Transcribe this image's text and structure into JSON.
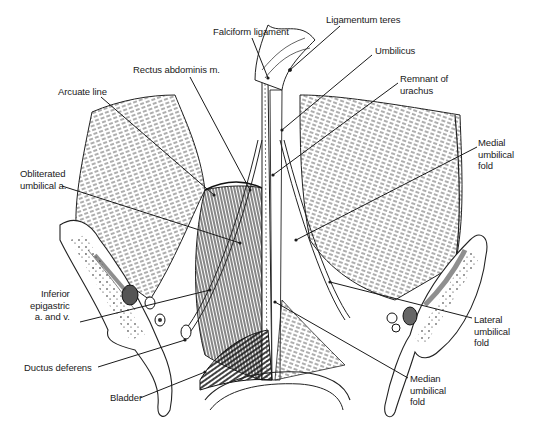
{
  "figure": {
    "width": 534,
    "height": 430,
    "ink_color": "#1a1a1a",
    "background": "#ffffff"
  },
  "labels": [
    {
      "id": "falciform-ligament",
      "text": "Falciform ligament",
      "x": 213,
      "y": 26,
      "align": "left",
      "line": [
        [
          252,
          38
        ],
        [
          268,
          78
        ]
      ]
    },
    {
      "id": "ligamentum-teres",
      "text": "Ligamentum teres",
      "x": 326,
      "y": 14,
      "align": "left",
      "line": [
        [
          340,
          26
        ],
        [
          290,
          70
        ]
      ]
    },
    {
      "id": "umbilicus",
      "text": "Umbilicus",
      "x": 375,
      "y": 45,
      "align": "left",
      "line": [
        [
          372,
          55
        ],
        [
          282,
          130
        ]
      ]
    },
    {
      "id": "rectus-abdominis",
      "text": "Rectus abdominis m.",
      "x": 133,
      "y": 64,
      "align": "left",
      "line": [
        [
          190,
          77
        ],
        [
          250,
          190
        ]
      ]
    },
    {
      "id": "remnant-of-urachus",
      "text": "Remnant of\nurachus",
      "x": 400,
      "y": 73,
      "align": "left",
      "line": [
        [
          398,
          83
        ],
        [
          273,
          175
        ]
      ]
    },
    {
      "id": "arcuate-line",
      "text": "Arcuate line",
      "x": 58,
      "y": 86,
      "align": "left",
      "line": [
        [
          101,
          97
        ],
        [
          214,
          195
        ]
      ]
    },
    {
      "id": "medial-umbilical-fold",
      "text": "Medial\numbilical\nfold",
      "x": 478,
      "y": 137,
      "align": "left",
      "line": [
        [
          477,
          147
        ],
        [
          296,
          240
        ]
      ]
    },
    {
      "id": "obliterated-umbilical-artery",
      "text": "Obliterated\numbilical a.",
      "x": 20,
      "y": 168,
      "align": "left",
      "line": [
        [
          62,
          186
        ],
        [
          240,
          243
        ]
      ]
    },
    {
      "id": "inferior-epigastric",
      "text": "Inferior\nepigastric\na. and v.",
      "x": 30,
      "y": 288,
      "align": "right",
      "line": [
        [
          80,
          322
        ],
        [
          210,
          290
        ]
      ]
    },
    {
      "id": "lateral-umbilical-fold",
      "text": "Lateral\numbilical\nfold",
      "x": 474,
      "y": 314,
      "align": "left",
      "line": [
        [
          472,
          318
        ],
        [
          330,
          282
        ]
      ]
    },
    {
      "id": "ductus-deferens",
      "text": "Ductus deferens",
      "x": 24,
      "y": 362,
      "align": "left",
      "line": [
        [
          98,
          367
        ],
        [
          185,
          340
        ]
      ]
    },
    {
      "id": "median-umbilical-fold",
      "text": "Median\numbilical\nfold",
      "x": 410,
      "y": 373,
      "align": "left",
      "line": [
        [
          408,
          378
        ],
        [
          275,
          302
        ]
      ]
    },
    {
      "id": "bladder",
      "text": "Bladder",
      "x": 110,
      "y": 392,
      "align": "left",
      "line": [
        [
          140,
          398
        ],
        [
          205,
          372
        ]
      ]
    }
  ]
}
